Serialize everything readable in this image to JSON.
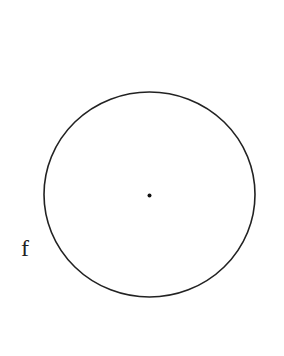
{
  "diagram": {
    "type": "geometry",
    "shapes": {
      "circle": {
        "cx": 149.5,
        "cy": 194.5,
        "rx": 105.5,
        "ry": 102.5,
        "stroke": "#222222",
        "stroke_width": 1.6
      },
      "center_point": {
        "cx": 149.5,
        "cy": 195.5,
        "r": 2,
        "fill": "#111111"
      }
    },
    "labels": {
      "circle_label": {
        "text": "f",
        "x": 21,
        "y": 256,
        "size": 24
      }
    }
  }
}
